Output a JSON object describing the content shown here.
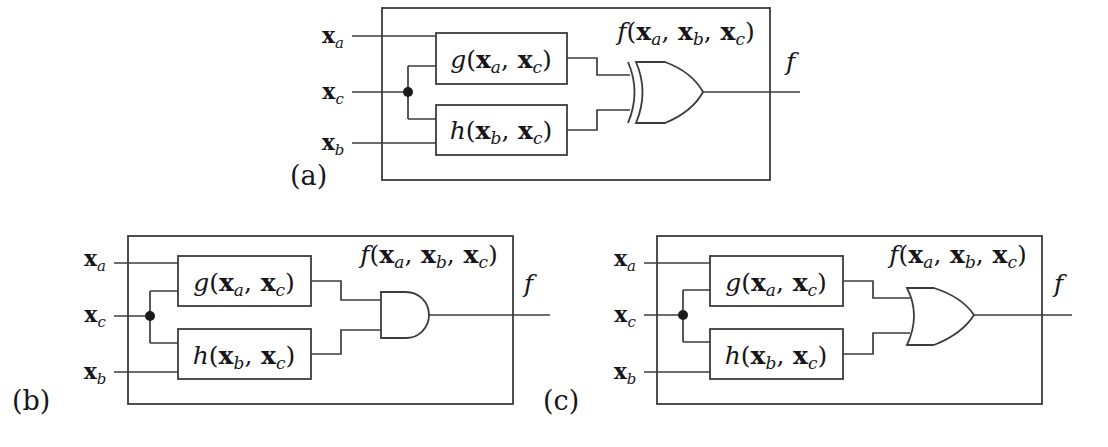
{
  "figure": {
    "background_color": "#ffffff",
    "line_color": "#3b3b42",
    "text_color": "#16161a",
    "panels": [
      {
        "id": "a",
        "label": "(a)",
        "gate_type": "XOR",
        "gate_name": "xor-gate",
        "inputs": [
          {
            "name": "input-xa",
            "label_main": "x",
            "label_sub": "a"
          },
          {
            "name": "input-xc",
            "label_main": "x",
            "label_sub": "c"
          },
          {
            "name": "input-xb",
            "label_main": "x",
            "label_sub": "b"
          }
        ],
        "blocks": [
          {
            "name": "function-block-g",
            "fn": "g",
            "args": [
              "a",
              "c"
            ]
          },
          {
            "name": "function-block-h",
            "fn": "h",
            "args": [
              "b",
              "c"
            ]
          }
        ],
        "internal_signal": {
          "fn": "f",
          "args": [
            "a",
            "b",
            "c"
          ]
        },
        "output_label": "f"
      },
      {
        "id": "b",
        "label": "(b)",
        "gate_type": "AND",
        "gate_name": "and-gate",
        "inputs": [
          {
            "name": "input-xa",
            "label_main": "x",
            "label_sub": "a"
          },
          {
            "name": "input-xc",
            "label_main": "x",
            "label_sub": "c"
          },
          {
            "name": "input-xb",
            "label_main": "x",
            "label_sub": "b"
          }
        ],
        "blocks": [
          {
            "name": "function-block-g",
            "fn": "g",
            "args": [
              "a",
              "c"
            ]
          },
          {
            "name": "function-block-h",
            "fn": "h",
            "args": [
              "b",
              "c"
            ]
          }
        ],
        "internal_signal": {
          "fn": "f",
          "args": [
            "a",
            "b",
            "c"
          ]
        },
        "output_label": "f"
      },
      {
        "id": "c",
        "label": "(c)",
        "gate_type": "OR",
        "gate_name": "or-gate",
        "inputs": [
          {
            "name": "input-xa",
            "label_main": "x",
            "label_sub": "a"
          },
          {
            "name": "input-xc",
            "label_main": "x",
            "label_sub": "c"
          },
          {
            "name": "input-xb",
            "label_main": "x",
            "label_sub": "b"
          }
        ],
        "blocks": [
          {
            "name": "function-block-g",
            "fn": "g",
            "args": [
              "a",
              "c"
            ]
          },
          {
            "name": "function-block-h",
            "fn": "h",
            "args": [
              "b",
              "c"
            ]
          }
        ],
        "internal_signal": {
          "fn": "f",
          "args": [
            "a",
            "b",
            "c"
          ]
        },
        "output_label": "f"
      }
    ]
  },
  "labels": {
    "panel_a": "(a)",
    "panel_b": "(b)",
    "panel_c": "(c)",
    "x_main": "x",
    "sub_a": "a",
    "sub_b": "b",
    "sub_c": "c",
    "g_name": "g",
    "h_name": "h",
    "f_name": "f",
    "paren_open": "(",
    "paren_close": ")",
    "comma": ",",
    "output_f": "f"
  }
}
